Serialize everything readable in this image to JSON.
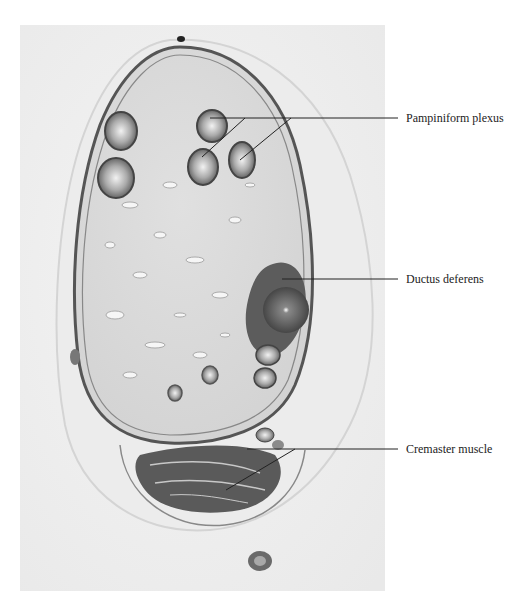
{
  "figure": {
    "type": "histology-micrograph",
    "labels": [
      {
        "text": "Pampiniform plexus",
        "x": 406,
        "y": 112
      },
      {
        "text": "Ductus deferens",
        "x": 406,
        "y": 272
      },
      {
        "text": "Cremaster muscle",
        "x": 406,
        "y": 441
      }
    ]
  }
}
